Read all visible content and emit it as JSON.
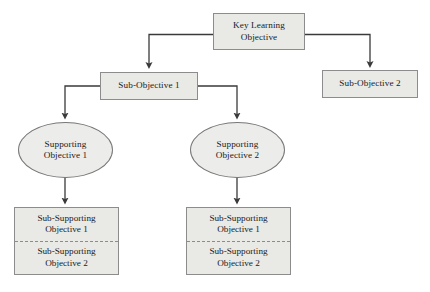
{
  "diagram": {
    "colors": {
      "box_fill": "#e9e9e6",
      "box_stroke": "#8c8c8c",
      "ellipse_fill": "#ececea",
      "ellipse_stroke": "#777777",
      "connector": "#3a3a3a",
      "text": "#1b1b1b",
      "background": "#ffffff"
    },
    "nodes": {
      "key_learning_objective": {
        "line1": "Key Learning",
        "line2": "Objective",
        "shape": "rectangle"
      },
      "sub_objective_1": {
        "line1": "Sub-Objective 1",
        "shape": "rectangle"
      },
      "sub_objective_2": {
        "line1": "Sub-Objective 2",
        "shape": "rectangle"
      },
      "supporting_objective_1": {
        "line1": "Supporting",
        "line2": "Objective 1",
        "shape": "ellipse"
      },
      "supporting_objective_2": {
        "line1": "Supporting",
        "line2": "Objective 2",
        "shape": "ellipse"
      },
      "sub_supporting_group_left": {
        "upper_line1": "Sub-Supporting",
        "upper_line2": "Objective 1",
        "lower_line1": "Sub-Supporting",
        "lower_line2": "Objective 2",
        "shape": "split-rectangle"
      },
      "sub_supporting_group_right": {
        "upper_line1": "Sub-Supporting",
        "upper_line2": "Objective 1",
        "lower_line1": "Sub-Supporting",
        "lower_line2": "Objective 2",
        "shape": "split-rectangle"
      }
    }
  }
}
